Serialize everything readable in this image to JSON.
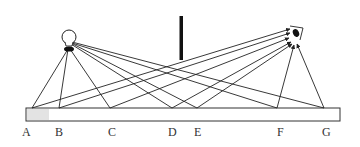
{
  "diagram": {
    "type": "light-reflection",
    "source": "light-bulb",
    "observer": "eye",
    "obstacle": "vertical-barrier",
    "surface": "plane-mirror",
    "points": [
      {
        "label": "A",
        "x": 27
      },
      {
        "label": "B",
        "x": 59
      },
      {
        "label": "C",
        "x": 112
      },
      {
        "label": "D",
        "x": 172
      },
      {
        "label": "E",
        "x": 198
      },
      {
        "label": "F",
        "x": 280
      },
      {
        "label": "G",
        "x": 327
      }
    ]
  },
  "labels": {
    "A": "A",
    "B": "B",
    "C": "C",
    "D": "D",
    "E": "E",
    "F": "F",
    "G": "G"
  },
  "colors": {
    "line": "#222222",
    "mirror_fill": "#ffffff",
    "shade": "#dcdcdc"
  }
}
